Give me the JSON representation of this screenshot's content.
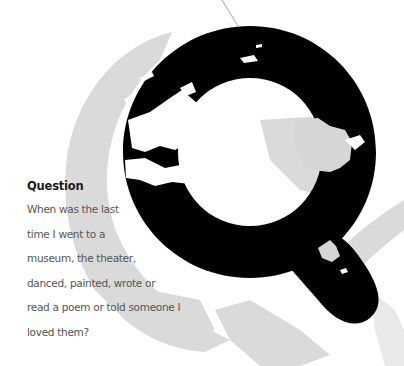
{
  "card": {
    "heading": "Question",
    "body_lines": [
      "When was the last",
      "time I went to a",
      "museum, the theater,",
      "danced, painted, wrote or",
      "read a poem or told someone I",
      "loved them?"
    ]
  },
  "graphic": {
    "glyph": "Q",
    "glyph_color": "#000000",
    "backdrop_color": "#d9d9d9",
    "background_color": "#ffffff"
  }
}
